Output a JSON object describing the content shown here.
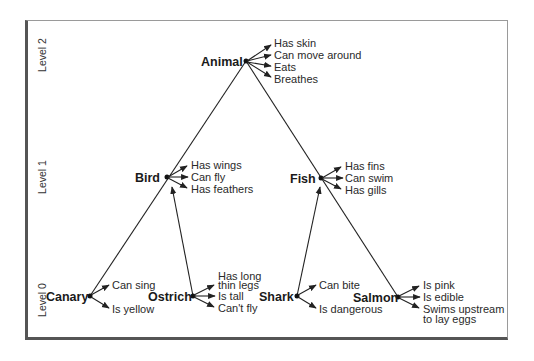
{
  "levels": [
    {
      "label": "Level 2",
      "y": 55
    },
    {
      "label": "Level 1",
      "y": 177
    },
    {
      "label": "Level 0",
      "y": 300
    }
  ],
  "nodes": {
    "animal": {
      "label": "Animal",
      "features": [
        "Has skin",
        "Can move around",
        "Eats",
        "Breathes"
      ]
    },
    "bird": {
      "label": "Bird",
      "features": [
        "Has wings",
        "Can fly",
        "Has feathers"
      ]
    },
    "fish": {
      "label": "Fish",
      "features": [
        "Has fins",
        "Can swim",
        "Has gills"
      ]
    },
    "canary": {
      "label": "Canary",
      "features": [
        "Can sing",
        "Is yellow"
      ]
    },
    "ostrich": {
      "label": "Ostrich",
      "features": [
        "Has long",
        "thin legs",
        "Is tall",
        "Can't fly"
      ]
    },
    "shark": {
      "label": "Shark",
      "features": [
        "Can bite",
        "Is dangerous"
      ]
    },
    "salmon": {
      "label": "Salmon",
      "features": [
        "Is pink",
        "Is edible",
        "Swims upstream",
        "to lay eggs"
      ]
    }
  },
  "colors": {
    "line": "#222222",
    "frame_shadow": "#555555",
    "frame_border": "#9a9a9a"
  }
}
